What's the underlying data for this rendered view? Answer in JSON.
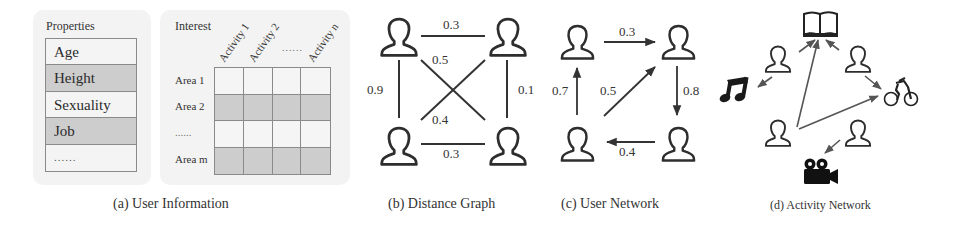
{
  "panels": {
    "a": {
      "caption": "(a) User Information",
      "properties": {
        "title": "Properties",
        "rows": [
          {
            "label": "Age",
            "shade": "light"
          },
          {
            "label": "Height",
            "shade": "dark"
          },
          {
            "label": "Sexuality",
            "shade": "light"
          },
          {
            "label": "Job",
            "shade": "dark"
          },
          {
            "label": "......",
            "shade": "light"
          }
        ]
      },
      "interest": {
        "title": "Interest",
        "columns": [
          "Activity 1",
          "Activity 2",
          "......",
          "Activity n"
        ],
        "rows": [
          "Area 1",
          "Area 2",
          "......",
          "Area m"
        ],
        "row_shades": [
          "light",
          "dark",
          "light",
          "dark"
        ]
      }
    },
    "b": {
      "caption": "(b) Distance Graph",
      "nodes": [
        "user-top-left",
        "user-top-right",
        "user-bottom-left",
        "user-bottom-right"
      ],
      "edges": [
        {
          "from": "user-top-left",
          "to": "user-top-right",
          "weight": "0.3",
          "directed": false
        },
        {
          "from": "user-bottom-left",
          "to": "user-bottom-right",
          "weight": "0.3",
          "directed": false
        },
        {
          "from": "user-top-left",
          "to": "user-bottom-left",
          "weight": "0.9",
          "directed": false
        },
        {
          "from": "user-top-right",
          "to": "user-bottom-right",
          "weight": "0.1",
          "directed": false
        },
        {
          "from": "user-top-left",
          "to": "user-bottom-right",
          "weight": "0.5",
          "directed": false
        },
        {
          "from": "user-bottom-left",
          "to": "user-top-right",
          "weight": "0.4",
          "directed": false
        }
      ]
    },
    "c": {
      "caption": "(c) User Network",
      "nodes": [
        "user-top-left",
        "user-top-right",
        "user-bottom-left",
        "user-bottom-right"
      ],
      "edges": [
        {
          "from": "user-top-left",
          "to": "user-top-right",
          "weight": "0.3",
          "directed": true
        },
        {
          "from": "user-top-right",
          "to": "user-bottom-right",
          "weight": "0.8",
          "directed": true
        },
        {
          "from": "user-bottom-right",
          "to": "user-bottom-left",
          "weight": "0.4",
          "directed": true
        },
        {
          "from": "user-bottom-left",
          "to": "user-top-left",
          "weight": "0.7",
          "directed": true
        },
        {
          "from": "user-bottom-left",
          "to": "user-top-right",
          "weight": "0.5",
          "directed": true
        }
      ]
    },
    "d": {
      "caption": "(d) Activity Network",
      "activities": [
        "book-icon",
        "music-icon",
        "bicycle-icon",
        "movie-camera-icon"
      ],
      "edges": [
        {
          "from": "user-top-left",
          "to": "book-icon"
        },
        {
          "from": "user-top-left",
          "to": "music-icon"
        },
        {
          "from": "user-top-right",
          "to": "book-icon"
        },
        {
          "from": "user-top-right",
          "to": "bicycle-icon"
        },
        {
          "from": "user-bottom-left",
          "to": "book-icon"
        },
        {
          "from": "user-bottom-left",
          "to": "bicycle-icon"
        },
        {
          "from": "user-bottom-right",
          "to": "movie-camera-icon"
        }
      ]
    }
  },
  "colors": {
    "stroke": "#333333",
    "cell_light": "#f5f5f5",
    "cell_dark": "#cdcdcd",
    "panel_bg": "#f3f3f3"
  }
}
